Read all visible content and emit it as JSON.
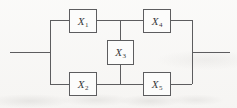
{
  "figure": {
    "kind": "reliability-bridge-network",
    "background_color": "#f7f6f4",
    "line_color": "#5d5d5f",
    "label_color": "#3a3a3c",
    "nodes": [
      {
        "id": "x1",
        "symbol": "X",
        "subscript": "1",
        "position": "top-left",
        "x": 69,
        "y": 9,
        "width": 28,
        "height": 24
      },
      {
        "id": "x4",
        "symbol": "X",
        "subscript": "4",
        "position": "top-right",
        "x": 143,
        "y": 9,
        "width": 28,
        "height": 24
      },
      {
        "id": "x3",
        "symbol": "X",
        "subscript": "3",
        "position": "middle-bridge",
        "x": 107,
        "y": 40,
        "width": 27,
        "height": 25
      },
      {
        "id": "x2",
        "symbol": "X",
        "subscript": "2",
        "position": "bottom-left",
        "x": 69,
        "y": 72,
        "width": 28,
        "height": 24
      },
      {
        "id": "x5",
        "symbol": "X",
        "subscript": "5",
        "position": "bottom-right",
        "x": 143,
        "y": 72,
        "width": 28,
        "height": 24
      }
    ],
    "wires": [
      {
        "id": "input-lead",
        "orientation": "h",
        "x": 10,
        "y": 52,
        "length": 40
      },
      {
        "id": "output-lead",
        "orientation": "h",
        "x": 192,
        "y": 52,
        "length": 38
      },
      {
        "id": "left-bus",
        "orientation": "v",
        "x": 50,
        "y": 20,
        "length": 64
      },
      {
        "id": "right-bus",
        "orientation": "v",
        "x": 192,
        "y": 20,
        "length": 64
      },
      {
        "id": "top-rail-left",
        "orientation": "h",
        "x": 50,
        "y": 20,
        "length": 19
      },
      {
        "id": "top-rail-mid",
        "orientation": "h",
        "x": 97,
        "y": 20,
        "length": 46
      },
      {
        "id": "top-rail-right",
        "orientation": "h",
        "x": 171,
        "y": 20,
        "length": 21
      },
      {
        "id": "bottom-rail-left",
        "orientation": "h",
        "x": 50,
        "y": 84,
        "length": 19
      },
      {
        "id": "bottom-rail-mid",
        "orientation": "h",
        "x": 97,
        "y": 84,
        "length": 46
      },
      {
        "id": "bottom-rail-right",
        "orientation": "h",
        "x": 171,
        "y": 84,
        "length": 21
      },
      {
        "id": "bridge-upper",
        "orientation": "v",
        "x": 120,
        "y": 20,
        "length": 20
      },
      {
        "id": "bridge-lower",
        "orientation": "v",
        "x": 120,
        "y": 65,
        "length": 19
      }
    ]
  }
}
